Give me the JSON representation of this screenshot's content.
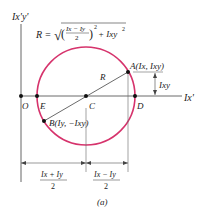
{
  "figure": {
    "caption": "(a)",
    "colors": {
      "circle": "#d6336c",
      "axes": "#555555",
      "text": "#222222",
      "line": "#444444"
    },
    "axes": {
      "vertical_label": "Ix'y'",
      "horizontal_label": "Ix'"
    },
    "formula": {
      "lhs": "R =",
      "numerator": "Ix − Iy",
      "denominator": "2",
      "exp": "2",
      "plus_term": "+ Ixy",
      "plus_exp": "2"
    },
    "points": {
      "O": "O",
      "E": "E",
      "C": "C",
      "D": "D",
      "A": "A(Ix, Ixy)",
      "B": "B(Iy, −Ixy)"
    },
    "radius_label": "R",
    "ixy_dimension_label": "Ixy",
    "bottom_dimensions": [
      {
        "numerator": "Ix + Iy",
        "denominator": "2"
      },
      {
        "numerator": "Ix − Iy",
        "denominator": "2"
      }
    ]
  }
}
